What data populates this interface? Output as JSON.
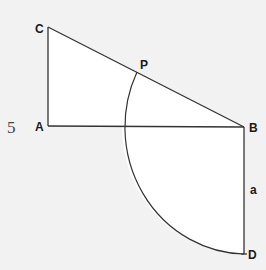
{
  "figure": {
    "number": "5",
    "points": {
      "C": {
        "label": "C",
        "x": 48,
        "y": 27
      },
      "A": {
        "label": "A",
        "x": 48,
        "y": 126
      },
      "B": {
        "label": "B",
        "x": 244,
        "y": 127
      },
      "P": {
        "label": "P",
        "x": 137,
        "y": 72
      },
      "D": {
        "label": "D",
        "x": 244,
        "y": 254
      }
    },
    "segment_label": "a",
    "colors": {
      "line": "#333333",
      "fill": "#ffffff",
      "background": "#f2f2f2"
    }
  }
}
